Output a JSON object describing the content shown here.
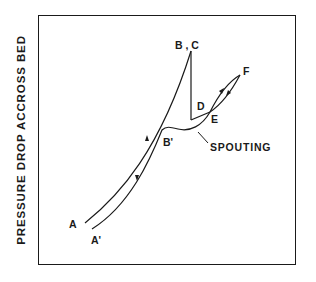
{
  "figure": {
    "y_axis_label": "PRESSURE DROP ACCROSS BED",
    "point_labels": {
      "A": "A",
      "A_prime": "A'",
      "B_prime": "B'",
      "BC": "B , C",
      "D": "D",
      "E": "E",
      "F": "F"
    },
    "annotation": "SPOUTING",
    "colors": {
      "line": "#1a1a1a",
      "background": "#ffffff"
    }
  }
}
